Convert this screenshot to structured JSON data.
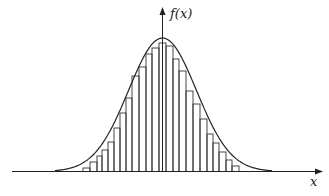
{
  "chart_data": {
    "type": "bar",
    "title": "",
    "xlabel": "x",
    "ylabel": "f(x)",
    "grid": false,
    "legend": null,
    "curve": "normal density",
    "bins": [
      {
        "x0": 83,
        "x1": 90,
        "top": 168
      },
      {
        "x0": 90,
        "x1": 97,
        "top": 162
      },
      {
        "x0": 97,
        "x1": 102,
        "top": 156
      },
      {
        "x0": 102,
        "x1": 108,
        "top": 150
      },
      {
        "x0": 108,
        "x1": 114,
        "top": 142
      },
      {
        "x0": 114,
        "x1": 120,
        "top": 128
      },
      {
        "x0": 120,
        "x1": 126,
        "top": 113
      },
      {
        "x0": 126,
        "x1": 132,
        "top": 98
      },
      {
        "x0": 132,
        "x1": 139,
        "top": 76
      },
      {
        "x0": 139,
        "x1": 146,
        "top": 67
      },
      {
        "x0": 146,
        "x1": 152,
        "top": 54
      },
      {
        "x0": 152,
        "x1": 159,
        "top": 48
      },
      {
        "x0": 159,
        "x1": 166,
        "top": 43
      },
      {
        "x0": 166,
        "x1": 173,
        "top": 46
      },
      {
        "x0": 173,
        "x1": 179,
        "top": 59
      },
      {
        "x0": 179,
        "x1": 186,
        "top": 71
      },
      {
        "x0": 186,
        "x1": 193,
        "top": 91
      },
      {
        "x0": 193,
        "x1": 200,
        "top": 104
      },
      {
        "x0": 200,
        "x1": 207,
        "top": 119
      },
      {
        "x0": 207,
        "x1": 213,
        "top": 134
      },
      {
        "x0": 213,
        "x1": 219,
        "top": 143
      },
      {
        "x0": 219,
        "x1": 226,
        "top": 152
      },
      {
        "x0": 226,
        "x1": 232,
        "top": 160
      },
      {
        "x0": 232,
        "x1": 239,
        "top": 166
      }
    ]
  },
  "axes": {
    "y_label": "f(x)",
    "x_label": "x"
  }
}
